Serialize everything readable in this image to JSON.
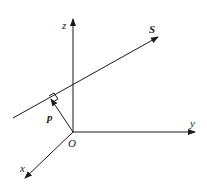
{
  "diagram": {
    "type": "3d-coordinate-axes-with-line",
    "labels": {
      "z_axis": "z",
      "y_axis": "y",
      "x_axis": "x",
      "origin": "O",
      "line": "S",
      "vector": "p"
    },
    "colors": {
      "stroke": "#1a1a1a",
      "background": "#ffffff"
    },
    "elements": [
      {
        "id": "z-axis",
        "from": [
          73,
          132
        ],
        "to": [
          73,
          18
        ],
        "arrow": true
      },
      {
        "id": "y-axis",
        "from": [
          73,
          132
        ],
        "to": [
          195,
          132
        ],
        "arrow": true
      },
      {
        "id": "x-axis",
        "from": [
          73,
          132
        ],
        "to": [
          25,
          178
        ],
        "arrow": true
      },
      {
        "id": "line-S",
        "from": [
          13,
          118
        ],
        "to": [
          158,
          37
        ],
        "arrow": true
      },
      {
        "id": "vector-p",
        "from": [
          73,
          132
        ],
        "to": [
          51,
          99
        ],
        "arrow": true
      },
      {
        "id": "right-angle-marker",
        "at": [
          51,
          99
        ]
      }
    ]
  }
}
